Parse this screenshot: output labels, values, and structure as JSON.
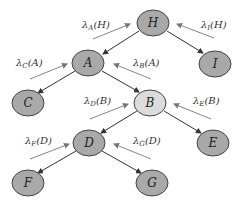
{
  "diagram": {
    "type": "bayesian-network-lambda-messages",
    "colors": {
      "node_fill": "#a9a9a9",
      "highlight_fill": "#dcdcdc",
      "node_stroke": "#444444",
      "edge": "#333333",
      "message_arrow": "#777777"
    },
    "nodes": [
      {
        "id": "H",
        "label": "H",
        "cx": 153,
        "cy": 23,
        "highlight": false
      },
      {
        "id": "I",
        "label": "I",
        "cx": 215,
        "cy": 64,
        "highlight": false
      },
      {
        "id": "A",
        "label": "A",
        "cx": 88,
        "cy": 63,
        "highlight": false
      },
      {
        "id": "C",
        "label": "C",
        "cx": 28,
        "cy": 103,
        "highlight": false
      },
      {
        "id": "B",
        "label": "B",
        "cx": 150,
        "cy": 103,
        "highlight": true
      },
      {
        "id": "E",
        "label": "E",
        "cx": 213,
        "cy": 143,
        "highlight": false
      },
      {
        "id": "D",
        "label": "D",
        "cx": 89,
        "cy": 143,
        "highlight": false
      },
      {
        "id": "F",
        "label": "F",
        "cx": 28,
        "cy": 183,
        "highlight": false
      },
      {
        "id": "G",
        "label": "G",
        "cx": 152,
        "cy": 183,
        "highlight": false
      }
    ],
    "edges": [
      {
        "from": "H",
        "to": "A"
      },
      {
        "from": "H",
        "to": "I"
      },
      {
        "from": "A",
        "to": "C"
      },
      {
        "from": "A",
        "to": "B"
      },
      {
        "from": "B",
        "to": "D"
      },
      {
        "from": "B",
        "to": "E"
      },
      {
        "from": "D",
        "to": "F"
      },
      {
        "from": "D",
        "to": "G"
      }
    ],
    "messages": [
      {
        "lambda": "λ",
        "sub": "A",
        "arg": "(H)",
        "from": "A",
        "to": "H"
      },
      {
        "lambda": "λ",
        "sub": "I",
        "arg": "(H)",
        "from": "I",
        "to": "H"
      },
      {
        "lambda": "λ",
        "sub": "C",
        "arg": "(A)",
        "from": "C",
        "to": "A"
      },
      {
        "lambda": "λ",
        "sub": "B",
        "arg": "(A)",
        "from": "B",
        "to": "A"
      },
      {
        "lambda": "λ",
        "sub": "D",
        "arg": "(B)",
        "from": "D",
        "to": "B"
      },
      {
        "lambda": "λ",
        "sub": "E",
        "arg": "(B)",
        "from": "E",
        "to": "B"
      },
      {
        "lambda": "λ",
        "sub": "F",
        "arg": "(D)",
        "from": "F",
        "to": "D"
      },
      {
        "lambda": "λ",
        "sub": "G",
        "arg": "(D)",
        "from": "G",
        "to": "D"
      }
    ]
  }
}
